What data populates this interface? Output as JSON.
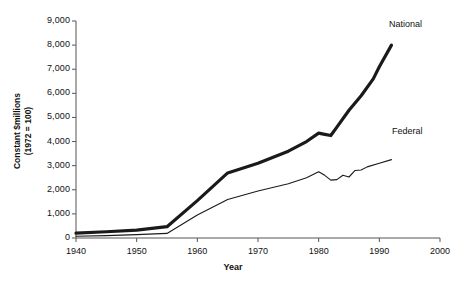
{
  "chart_data": {
    "type": "line",
    "title": "",
    "xlabel": "Year",
    "ylabel": "Constant $millions\n(1972 = 100)",
    "ylabel_line1": "Constant $millions",
    "ylabel_line2": "(1972 = 100)",
    "xlim": [
      1940,
      2000
    ],
    "ylim": [
      0,
      9000
    ],
    "grid": false,
    "legend_position": "inline-right-of-line-ends",
    "xticks": [
      1940,
      1950,
      1960,
      1970,
      1980,
      1990,
      2000
    ],
    "xtick_labels": [
      "1940",
      "1950",
      "1960",
      "1970",
      "1980",
      "1990",
      "2000"
    ],
    "yticks": [
      0,
      1000,
      2000,
      3000,
      4000,
      5000,
      6000,
      7000,
      8000,
      9000
    ],
    "ytick_labels": [
      "0",
      "1,000",
      "2,000",
      "3,000",
      "4,000",
      "5,000",
      "6,000",
      "7,000",
      "8,000",
      "9,000"
    ],
    "series": [
      {
        "name": "National",
        "line_width": 3.2,
        "color": "#1a1a1a",
        "x": [
          1940,
          1945,
          1950,
          1955,
          1960,
          1965,
          1970,
          1975,
          1978,
          1980,
          1981,
          1982,
          1983,
          1985,
          1987,
          1989,
          1990,
          1992
        ],
        "values": [
          200,
          260,
          330,
          470,
          1550,
          2700,
          3100,
          3600,
          4000,
          4350,
          4300,
          4250,
          4600,
          5300,
          5900,
          6600,
          7100,
          8000
        ]
      },
      {
        "name": "Federal",
        "line_width": 1.1,
        "color": "#1a1a1a",
        "x": [
          1940,
          1945,
          1950,
          1955,
          1960,
          1965,
          1970,
          1975,
          1978,
          1980,
          1981,
          1982,
          1983,
          1984,
          1985,
          1986,
          1987,
          1988,
          1990,
          1992
        ],
        "values": [
          70,
          100,
          140,
          190,
          950,
          1600,
          1950,
          2250,
          2500,
          2750,
          2600,
          2400,
          2420,
          2600,
          2530,
          2800,
          2820,
          2950,
          3100,
          3250
        ]
      }
    ],
    "annotations": [
      {
        "text": "National",
        "x": 1993,
        "y": 8300
      },
      {
        "text": "Federal",
        "x": 1993,
        "y": 3750
      }
    ]
  }
}
